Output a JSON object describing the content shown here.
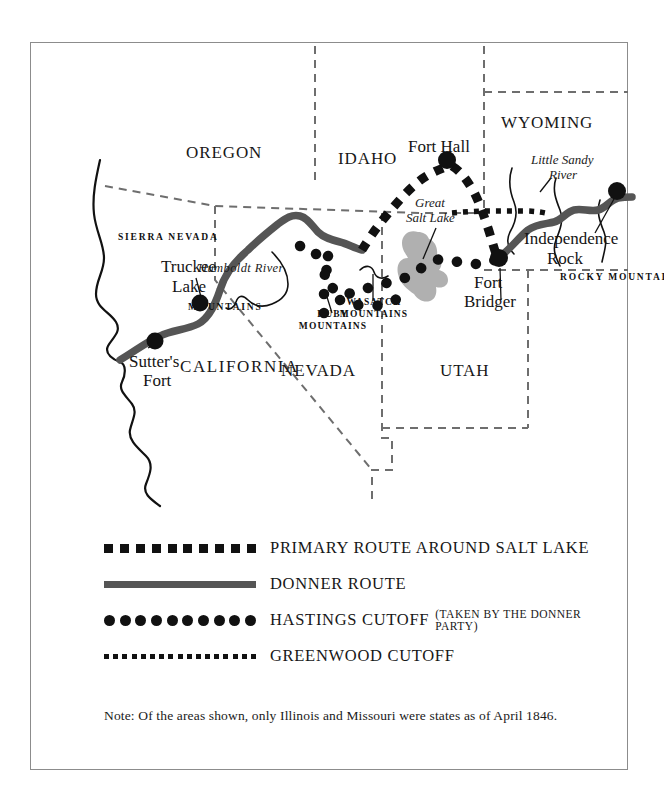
{
  "map": {
    "title_note": "Note: Of the areas shown, only Illinois and Missouri were states as of April 1846.",
    "states": [
      {
        "name": "OREGON",
        "label": "OREGON"
      },
      {
        "name": "IDAHO",
        "label": "IDAHO"
      },
      {
        "name": "WYOMING",
        "label": "WYOMING"
      },
      {
        "name": "NEVADA",
        "label": "NEVADA"
      },
      {
        "name": "UTAH",
        "label": "UTAH"
      },
      {
        "name": "CALIFORNIA",
        "label": "CALIFORNIA"
      }
    ],
    "places": [
      {
        "name": "fort-hall",
        "label": "Fort Hall"
      },
      {
        "name": "independence-rock",
        "label": "Independence\nRock"
      },
      {
        "name": "independence-rock-line1",
        "label": "Independence"
      },
      {
        "name": "independence-rock-line2",
        "label": "Rock"
      },
      {
        "name": "fort-bridger-line1",
        "label": "Fort"
      },
      {
        "name": "fort-bridger-line2",
        "label": "Bridger"
      },
      {
        "name": "truckee-lake-line1",
        "label": "Truckee"
      },
      {
        "name": "truckee-lake-line2",
        "label": "Lake"
      },
      {
        "name": "sutters-fort-line1",
        "label": "Sutter's"
      },
      {
        "name": "sutters-fort-line2",
        "label": "Fort"
      }
    ],
    "water": [
      {
        "name": "great-salt-lake-line1",
        "label": "Great"
      },
      {
        "name": "great-salt-lake-line2",
        "label": "Salt Lake"
      },
      {
        "name": "little-sandy-river-line1",
        "label": "Little Sandy"
      },
      {
        "name": "little-sandy-river-line2",
        "label": "River"
      },
      {
        "name": "humboldt-river",
        "label": "Humboldt River"
      }
    ],
    "ranges": [
      {
        "name": "ruby-mountains-line1",
        "label": "RUBY"
      },
      {
        "name": "ruby-mountains-line2",
        "label": "MOUNTAINS"
      },
      {
        "name": "wasatch-mountains-line1",
        "label": "WASATCH"
      },
      {
        "name": "wasatch-mountains-line2",
        "label": "MOUNTAINS"
      },
      {
        "name": "sierra-nevada",
        "label": "SIERRA NEVADA"
      },
      {
        "name": "sierra-mountains",
        "label": "MOUNTAINS"
      },
      {
        "name": "rocky-mountains",
        "label": "ROCKY MOUNTAINS"
      }
    ],
    "colors": {
      "route_gray": "#555555",
      "ink": "#111111",
      "lake_fill": "#b0b0b0",
      "border_dash": "#6e6e6e",
      "frame": "#8c8c8c"
    }
  },
  "legend": {
    "rows": [
      {
        "name": "primary-route",
        "style": "dashed-square",
        "label": "PRIMARY ROUTE AROUND SALT LAKE",
        "sub": ""
      },
      {
        "name": "donner-route",
        "style": "solid-thick",
        "label": "DONNER ROUTE",
        "sub": ""
      },
      {
        "name": "hastings-cutoff",
        "style": "dotted-circle",
        "label": "HASTINGS CUTOFF",
        "sub": "(TAKEN BY THE DONNER PARTY)"
      },
      {
        "name": "greenwood-cutoff",
        "style": "fine-dotted",
        "label": "GREENWOOD CUTOFF",
        "sub": ""
      }
    ]
  }
}
